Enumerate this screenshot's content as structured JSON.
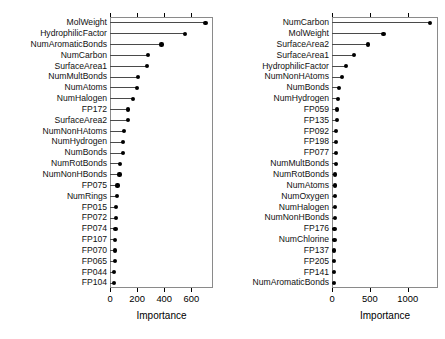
{
  "figure": {
    "background": "#ffffff",
    "dot_color": "#000000",
    "line_color": "#4a4a4a",
    "frame_color": "#8a8a8a"
  },
  "chart_data": [
    {
      "type": "bar",
      "orientation": "horizontal",
      "style": "dotchart",
      "panel": "left",
      "title": "",
      "xlabel": "Importance",
      "ylabel": "",
      "xlim": [
        0,
        760
      ],
      "xticks": [
        0,
        200,
        400,
        600
      ],
      "xticklabels": [
        "0",
        "200",
        "400",
        "600"
      ],
      "grid": false,
      "legend": null,
      "categories": [
        "MolWeight",
        "HydrophilicFactor",
        "NumAromaticBonds",
        "NumCarbon",
        "SurfaceArea1",
        "NumMultBonds",
        "NumAtoms",
        "NumHalogen",
        "FP172",
        "SurfaceArea2",
        "NumNonHAtoms",
        "NumHydrogen",
        "NumBonds",
        "NumRotBonds",
        "NumNonHBonds",
        "FP075",
        "NumRings",
        "FP015",
        "FP072",
        "FP074",
        "FP107",
        "FP070",
        "FP065",
        "FP044",
        "FP104"
      ],
      "values": [
        705,
        552,
        380,
        282,
        272,
        205,
        198,
        172,
        133,
        130,
        102,
        98,
        96,
        72,
        70,
        55,
        52,
        46,
        42,
        40,
        38,
        36,
        34,
        32,
        30
      ]
    },
    {
      "type": "bar",
      "orientation": "horizontal",
      "style": "dotchart",
      "panel": "right",
      "title": "",
      "xlabel": "Importance",
      "ylabel": "",
      "xlim": [
        0,
        1400
      ],
      "xticks": [
        0,
        500,
        1000
      ],
      "xticklabels": [
        "0",
        "500",
        "1000"
      ],
      "grid": false,
      "legend": null,
      "categories": [
        "NumCarbon",
        "MolWeight",
        "SurfaceArea2",
        "SurfaceArea1",
        "HydrophilicFactor",
        "NumNonHAtoms",
        "NumBonds",
        "NumHydrogen",
        "FP059",
        "FP135",
        "FP092",
        "FP198",
        "FP077",
        "NumMultBonds",
        "NumRotBonds",
        "NumAtoms",
        "NumOxygen",
        "NumHalogen",
        "NumNonHBonds",
        "FP176",
        "NumChlorine",
        "FP137",
        "FP205",
        "FP141",
        "NumAromaticBonds"
      ],
      "values": [
        1290,
        680,
        480,
        295,
        180,
        135,
        88,
        80,
        68,
        62,
        58,
        55,
        52,
        48,
        45,
        42,
        40,
        38,
        36,
        34,
        32,
        30,
        28,
        26,
        24
      ]
    }
  ]
}
